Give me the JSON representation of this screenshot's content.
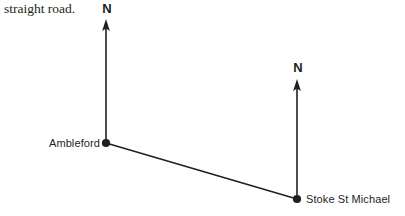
{
  "document": {
    "question_text": "straight road."
  },
  "diagram": {
    "background_color": "#ffffff",
    "stroke_color": "#231f20",
    "places": [
      {
        "id": "ambleford",
        "label": "Ambleford",
        "x": 106,
        "y": 143,
        "label_position": "left"
      },
      {
        "id": "stoke-st-michael",
        "label": "Stoke St Michael",
        "x": 297,
        "y": 199,
        "label_position": "right"
      }
    ],
    "north_arrows": [
      {
        "id": "north-ambleford",
        "letter": "N",
        "base_x": 106,
        "base_y": 143,
        "tip_y": 20
      },
      {
        "id": "north-stoke",
        "letter": "N",
        "base_x": 297,
        "base_y": 199,
        "tip_y": 80
      }
    ],
    "road": {
      "id": "road-ambleford-stoke",
      "from": "ambleford",
      "to": "stoke-st-michael",
      "x1": 106,
      "y1": 143,
      "x2": 297,
      "y2": 199
    }
  }
}
